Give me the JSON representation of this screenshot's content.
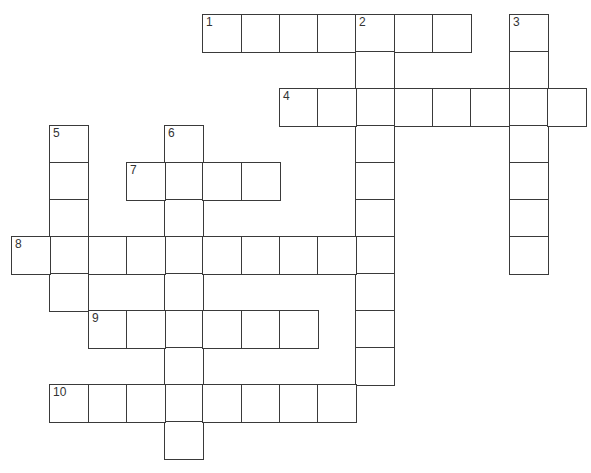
{
  "puzzle": {
    "type": "crossword",
    "grid": {
      "origin_x": 11,
      "origin_y": 14,
      "col_step": 38.27,
      "row_step": 37,
      "cell_w": 38,
      "cell_h": 37
    },
    "entries": [
      {
        "number": "1",
        "direction": "across",
        "row": 0,
        "col": 5,
        "length": 7
      },
      {
        "number": "2",
        "direction": "down",
        "row": 0,
        "col": 9,
        "length": 10
      },
      {
        "number": "3",
        "direction": "down",
        "row": 0,
        "col": 13,
        "length": 7
      },
      {
        "number": "4",
        "direction": "across",
        "row": 2,
        "col": 7,
        "length": 8
      },
      {
        "number": "5",
        "direction": "down",
        "row": 3,
        "col": 1,
        "length": 5
      },
      {
        "number": "6",
        "direction": "down",
        "row": 3,
        "col": 4,
        "length": 9
      },
      {
        "number": "7",
        "direction": "across",
        "row": 4,
        "col": 3,
        "length": 4
      },
      {
        "number": "8",
        "direction": "across",
        "row": 6,
        "col": 0,
        "length": 10
      },
      {
        "number": "9",
        "direction": "across",
        "row": 8,
        "col": 2,
        "length": 6
      },
      {
        "number": "10",
        "direction": "across",
        "row": 10,
        "col": 1,
        "length": 8
      }
    ],
    "colors": {
      "line": "#3a3a3a",
      "background": "#ffffff",
      "number": "#333333"
    }
  }
}
